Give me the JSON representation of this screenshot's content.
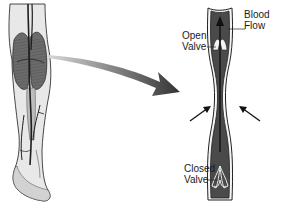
{
  "diagram": {
    "labels": {
      "blood_flow": {
        "line1": "Blood",
        "line2": "Flow"
      },
      "open_valve": {
        "line1": "Open",
        "line2": "Valve"
      },
      "closed_valve": {
        "line1": "Closed",
        "line2": "Valve"
      }
    },
    "colors": {
      "vein_fill": "#4a4a4a",
      "vein_wall": "#2a2a2a",
      "leg_fill": "#e4e4e4",
      "muscle_fill": "#6a6a6a",
      "arrow": "#222222"
    }
  }
}
